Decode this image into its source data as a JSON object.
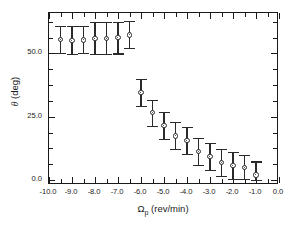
{
  "chart_data": {
    "type": "scatter",
    "title": "",
    "xlabel": "Ωp (rev/min)",
    "ylabel": "θ (deg)",
    "xlim": [
      -10.0,
      0.0
    ],
    "ylim": [
      -2.0,
      66.0
    ],
    "grid": false,
    "legend": null,
    "marker": "open-circle",
    "errorbars": "vertical",
    "xticks": [
      -10.0,
      -9.0,
      -8.0,
      -7.0,
      -6.0,
      -5.0,
      -4.0,
      -3.0,
      -2.0,
      -1.0,
      0.0
    ],
    "xticklabels": [
      "-10.0",
      "-9.0",
      "-8.0",
      "-7.0",
      "-6.0",
      "-5.0",
      "-4.0",
      "-3.0",
      "-2.0",
      "-1.0",
      "0.0"
    ],
    "yticks": [
      0.0,
      25.0,
      50.0
    ],
    "yticklabels": [
      "0.0",
      "25.0",
      "50.0"
    ],
    "y_minor_ticks": [
      6.25,
      12.5,
      18.75,
      31.25,
      37.5,
      43.75,
      56.25,
      62.5
    ],
    "x_minor_ticks": [
      -9.5,
      -8.5,
      -7.5,
      -6.5,
      -5.5,
      -4.5,
      -3.5,
      -2.5,
      -1.5,
      -0.5
    ],
    "points": [
      {
        "x": -9.5,
        "y": 55.5,
        "yerr_low": 5.2,
        "yerr_high": 5.5
      },
      {
        "x": -9.0,
        "y": 55.2,
        "yerr_low": 5.3,
        "yerr_high": 5.6
      },
      {
        "x": -8.5,
        "y": 55.4,
        "yerr_low": 5.2,
        "yerr_high": 5.5
      },
      {
        "x": -8.0,
        "y": 56.0,
        "yerr_low": 6.1,
        "yerr_high": 6.3
      },
      {
        "x": -7.5,
        "y": 56.0,
        "yerr_low": 6.1,
        "yerr_high": 6.3
      },
      {
        "x": -7.0,
        "y": 56.2,
        "yerr_low": 6.2,
        "yerr_high": 6.3
      },
      {
        "x": -6.5,
        "y": 57.3,
        "yerr_low": 5.2,
        "yerr_high": 5.4
      },
      {
        "x": -6.0,
        "y": 34.6,
        "yerr_low": 5.3,
        "yerr_high": 5.4
      },
      {
        "x": -5.5,
        "y": 26.6,
        "yerr_low": 5.4,
        "yerr_high": 5.2
      },
      {
        "x": -5.0,
        "y": 21.5,
        "yerr_low": 5.2,
        "yerr_high": 5.3
      },
      {
        "x": -4.5,
        "y": 17.4,
        "yerr_low": 5.3,
        "yerr_high": 5.4
      },
      {
        "x": -4.0,
        "y": 15.6,
        "yerr_low": 5.2,
        "yerr_high": 5.4
      },
      {
        "x": -3.5,
        "y": 11.2,
        "yerr_low": 5.3,
        "yerr_high": 5.4
      },
      {
        "x": -3.0,
        "y": 9.2,
        "yerr_low": 5.2,
        "yerr_high": 5.4
      },
      {
        "x": -2.5,
        "y": 7.0,
        "yerr_low": 5.3,
        "yerr_high": 5.4
      },
      {
        "x": -2.0,
        "y": 5.6,
        "yerr_low": 5.3,
        "yerr_high": 5.4
      },
      {
        "x": -1.5,
        "y": 4.8,
        "yerr_low": 4.5,
        "yerr_high": 5.2
      },
      {
        "x": -1.0,
        "y": 2.0,
        "yerr_low": 2.0,
        "yerr_high": 5.3
      }
    ]
  }
}
